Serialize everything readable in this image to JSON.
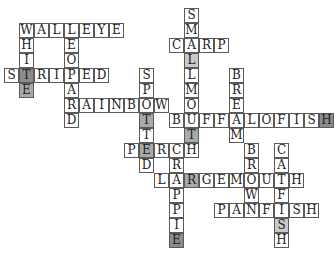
{
  "puzzle": {
    "type": "crossword-fish-names",
    "cell_size": 15,
    "origin": {
      "x": 4,
      "y": 8
    },
    "shades": {
      "dark": "#8c8c8c",
      "medium": "#a9a9a9",
      "light": "#c9c9c9"
    },
    "words": [
      {
        "word": "SMALLMOUTH",
        "dir": "down",
        "col": 12,
        "row": 0
      },
      {
        "word": "WALLEYE",
        "dir": "across",
        "col": 1,
        "row": 1
      },
      {
        "word": "WHITE",
        "dir": "down",
        "col": 1,
        "row": 1
      },
      {
        "word": "LEOPARD",
        "dir": "down",
        "col": 4,
        "row": 1
      },
      {
        "word": "CARP",
        "dir": "across",
        "col": 11,
        "row": 2
      },
      {
        "word": "STRIPED",
        "dir": "across",
        "col": 0,
        "row": 4
      },
      {
        "word": "SPOTTED",
        "dir": "down",
        "col": 9,
        "row": 4
      },
      {
        "word": "BREAM",
        "dir": "down",
        "col": 15,
        "row": 4
      },
      {
        "word": "RAINBOW",
        "dir": "across",
        "col": 4,
        "row": 6
      },
      {
        "word": "BUFFALOFISH",
        "dir": "across",
        "col": 11,
        "row": 7
      },
      {
        "word": "PERCH",
        "dir": "across",
        "col": 8,
        "row": 9
      },
      {
        "word": "CRAPPIE",
        "dir": "down",
        "col": 11,
        "row": 9
      },
      {
        "word": "BROWN",
        "dir": "down",
        "col": 16,
        "row": 9
      },
      {
        "word": "CATFISH",
        "dir": "down",
        "col": 18,
        "row": 9
      },
      {
        "word": "LARGEMOUTH",
        "dir": "across",
        "col": 10,
        "row": 11
      },
      {
        "word": "PANFISH",
        "dir": "across",
        "col": 14,
        "row": 13
      }
    ],
    "shaded_cells": [
      {
        "col": 1,
        "row": 4,
        "shade": "dark"
      },
      {
        "col": 1,
        "row": 5,
        "shade": "medium"
      },
      {
        "col": 12,
        "row": 3,
        "shade": "light"
      },
      {
        "col": 9,
        "row": 7,
        "shade": "medium"
      },
      {
        "col": 12,
        "row": 8,
        "shade": "medium"
      },
      {
        "col": 21,
        "row": 7,
        "shade": "dark"
      },
      {
        "col": 9,
        "row": 9,
        "shade": "medium"
      },
      {
        "col": 12,
        "row": 11,
        "shade": "medium"
      },
      {
        "col": 11,
        "row": 15,
        "shade": "dark"
      },
      {
        "col": 18,
        "row": 14,
        "shade": "light"
      }
    ]
  }
}
